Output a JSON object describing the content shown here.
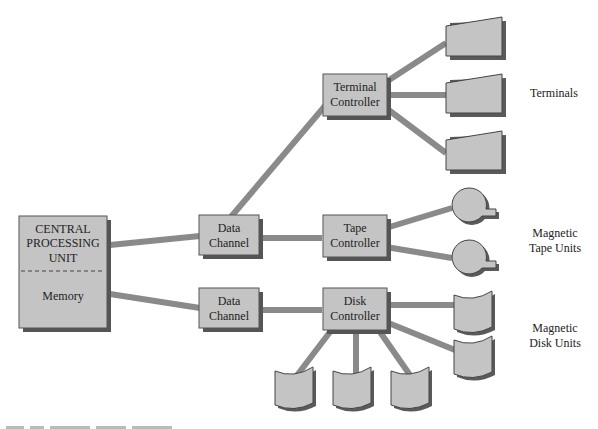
{
  "diagram": {
    "cpu": {
      "lines": [
        "CENTRAL",
        "PROCESSING",
        "UNIT"
      ],
      "memory": "Memory"
    },
    "data_channel_1": {
      "lines": [
        "Data",
        "Channel"
      ]
    },
    "data_channel_2": {
      "lines": [
        "Data",
        "Channel"
      ]
    },
    "terminal_controller": {
      "lines": [
        "Terminal",
        "Controller"
      ]
    },
    "tape_controller": {
      "lines": [
        "Tape",
        "Controller"
      ]
    },
    "disk_controller": {
      "lines": [
        "Disk",
        "Controller"
      ]
    },
    "labels": {
      "terminals": "Terminals",
      "tape_units": [
        "Magnetic",
        "Tape Units"
      ],
      "disk_units": [
        "Magnetic",
        "Disk Units"
      ]
    },
    "device_counts": {
      "terminals": 3,
      "tape_units": 2,
      "disk_units": 5
    },
    "colors": {
      "box_fill": "#c4c4c4",
      "shadow": "#555555",
      "connector": "#8a8a8a",
      "text": "#222222"
    }
  }
}
